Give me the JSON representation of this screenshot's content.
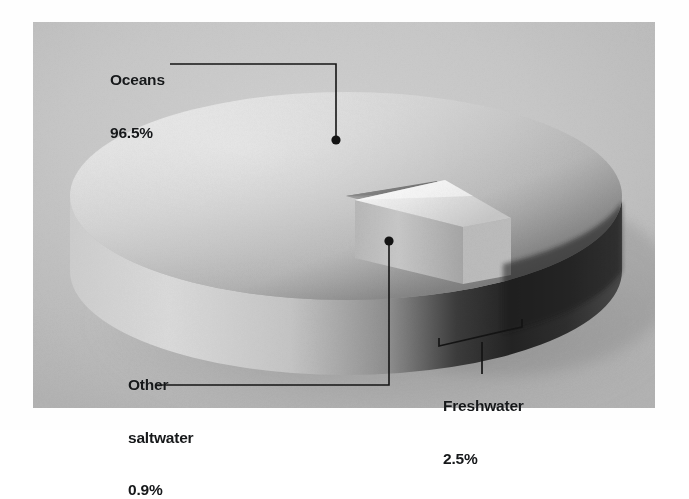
{
  "figure": {
    "kind": "photographic 3d exploded pie chart",
    "background_color": "#c9c9c9",
    "page_color": "#ffffff"
  },
  "labels": {
    "oceans": {
      "name": "Oceans",
      "value": "96.5%"
    },
    "other_saltwater": {
      "name_line1": "Other",
      "name_line2": "saltwater",
      "value": "0.9%"
    },
    "freshwater": {
      "name": "Freshwater",
      "value": "2.5%"
    }
  },
  "chart_data": {
    "type": "pie",
    "title": "",
    "subtitle": "",
    "xlabel": "",
    "ylabel": "",
    "legend_position": "callout-labels",
    "grid": false,
    "three_d": true,
    "exploded_slices": [
      "Freshwater"
    ],
    "units": "percent",
    "total": 100,
    "categories": [
      "Oceans",
      "Freshwater",
      "Other saltwater"
    ],
    "values": [
      96.5,
      2.5,
      0.9
    ],
    "labels_shown": [
      "Oceans 96.5%",
      "Freshwater 2.5%",
      "Other saltwater 0.9%"
    ],
    "colors": [
      "#c0c0c0",
      "#e8e8e8",
      "#3a3a3a"
    ],
    "series": [
      {
        "name": "Earth's water distribution",
        "values": [
          96.5,
          2.5,
          0.9
        ]
      }
    ]
  },
  "annotations": {
    "oceans_leader": "horizontal line from label to elbow, then vertical down to dot on pie top face",
    "other_saltwater_leader": "horizontal line from label right, then vertical up to dot on dark sliver",
    "freshwater_leader": "bracket spanning wedge base with stem down to label"
  }
}
